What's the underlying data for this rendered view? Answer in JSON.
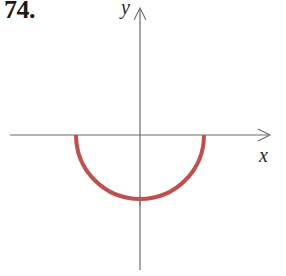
{
  "figure": {
    "problem_number": "74.",
    "axes": {
      "x_label": "x",
      "y_label": "y",
      "origin_px": [
        140,
        135
      ],
      "x_axis_px": {
        "from": 10,
        "to": 270
      },
      "y_axis_px": {
        "from": 8,
        "to": 270
      }
    },
    "curve": {
      "description": "lower semicircle centered at origin",
      "color": "#c0504d",
      "radius_px": 64,
      "stroke_width": 4
    },
    "colors": {
      "axis": "#6b6b6b",
      "curve": "#c0504d",
      "text": "#1a1a1a"
    }
  }
}
